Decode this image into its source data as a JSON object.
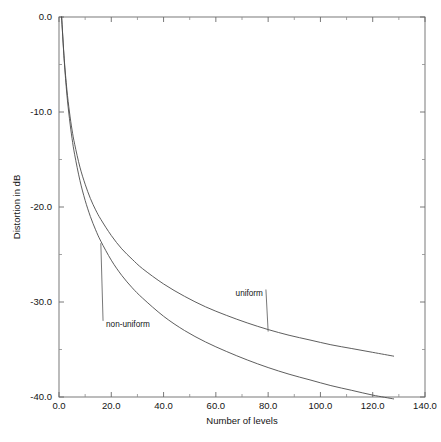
{
  "chart_data": {
    "type": "line",
    "title": "",
    "xlabel": "Number of levels",
    "ylabel": "Distortion in dB",
    "xlim": [
      0.0,
      140.0
    ],
    "ylim": [
      -40.0,
      0.0
    ],
    "grid": false,
    "legend_position": "inline-annotations",
    "x_ticks": [
      "0.0",
      "20.0",
      "40.0",
      "60.0",
      "80.0",
      "100.0",
      "120.0",
      "140.0"
    ],
    "x_tick_values": [
      0.0,
      20.0,
      40.0,
      60.0,
      80.0,
      100.0,
      120.0,
      140.0
    ],
    "x_minor_step": 10.0,
    "y_ticks": [
      "0.0",
      "-10.0",
      "-20.0",
      "-30.0",
      "-40.0"
    ],
    "y_tick_values": [
      0.0,
      -10.0,
      -20.0,
      -30.0,
      -40.0
    ],
    "y_minor_step": 5.0,
    "series": [
      {
        "name": "uniform",
        "label": "uniform",
        "color": "#4c4c4c",
        "x": [
          1,
          2,
          3,
          4,
          5,
          6,
          8,
          10,
          12,
          14,
          16,
          20,
          24,
          28,
          32,
          40,
          48,
          56,
          64,
          72,
          80,
          88,
          96,
          104,
          112,
          120,
          128
        ],
        "values": [
          0.0,
          -4.4,
          -7.6,
          -10.0,
          -11.9,
          -13.4,
          -15.8,
          -17.6,
          -19.1,
          -20.3,
          -21.3,
          -23.0,
          -24.4,
          -25.5,
          -26.5,
          -28.1,
          -29.4,
          -30.5,
          -31.4,
          -32.2,
          -32.9,
          -33.5,
          -34.0,
          -34.5,
          -34.9,
          -35.3,
          -35.7
        ]
      },
      {
        "name": "non-uniform",
        "label": "non-uniform",
        "color": "#4c4c4c",
        "x": [
          1,
          2,
          3,
          4,
          5,
          6,
          8,
          10,
          12,
          14,
          16,
          20,
          24,
          28,
          32,
          40,
          48,
          56,
          64,
          72,
          80,
          88,
          96,
          104,
          112,
          120,
          128
        ],
        "values": [
          0.0,
          -4.6,
          -8.1,
          -10.7,
          -12.8,
          -14.5,
          -17.2,
          -19.3,
          -21.0,
          -22.4,
          -23.6,
          -25.6,
          -27.2,
          -28.5,
          -29.6,
          -31.5,
          -33.0,
          -34.2,
          -35.2,
          -36.1,
          -36.9,
          -37.6,
          -38.2,
          -38.8,
          -39.3,
          -39.8,
          -40.2
        ]
      }
    ],
    "annotations": [
      {
        "text": "uniform",
        "x_data": 78.0,
        "y_data": -29.0
      },
      {
        "text": "non-uniform",
        "x_data": 18.0,
        "y_data": -32.3
      }
    ]
  }
}
